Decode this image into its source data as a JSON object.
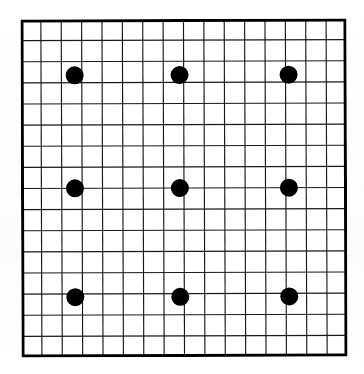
{
  "figure": {
    "background_color": "#fefefe",
    "line_color": "#1a1a1a",
    "dot_color": "#000000",
    "border_color": "#000000"
  },
  "chart_data": {
    "type": "scatter",
    "title": "",
    "subtitle": "",
    "xlabel": "",
    "ylabel": "",
    "grid": true,
    "grid_columns": 16,
    "grid_rows": 16,
    "legend": "none",
    "xlim": [
      0,
      16
    ],
    "ylim": [
      0,
      16
    ],
    "categories": [],
    "tick_labels_x": [],
    "tick_labels_y": [],
    "annotations": [],
    "series": [
      {
        "name": "dots",
        "marker": "filled-circle",
        "marker_color": "#000000",
        "marker_radius_px": 9,
        "points": [
          {
            "label": "top-left",
            "x": 2.65,
            "y": 2.65
          },
          {
            "label": "top-center",
            "x": 7.8,
            "y": 2.65
          },
          {
            "label": "top-right",
            "x": 13.15,
            "y": 2.65
          },
          {
            "label": "middle-left",
            "x": 2.65,
            "y": 8.0
          },
          {
            "label": "middle-center",
            "x": 7.8,
            "y": 8.0
          },
          {
            "label": "middle-right",
            "x": 13.15,
            "y": 8.0
          },
          {
            "label": "bottom-left",
            "x": 2.65,
            "y": 13.15
          },
          {
            "label": "bottom-center",
            "x": 7.8,
            "y": 13.15
          },
          {
            "label": "bottom-right",
            "x": 13.15,
            "y": 13.15
          }
        ]
      }
    ]
  },
  "geometry": {
    "box_left": 21,
    "box_top": 19,
    "box_width": 326,
    "box_height": 338,
    "border_width": 3,
    "cell_width": 20.375,
    "cell_height": 21.125,
    "grid_line_width": 1.15
  }
}
